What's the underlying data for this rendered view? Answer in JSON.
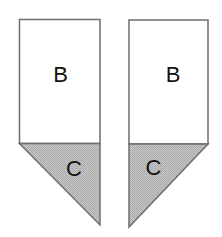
{
  "diagram": {
    "colors": {
      "background": "#ffffff",
      "stroke": "#6e6e6e",
      "fill_rect": "#ffffff",
      "fill_triangle": "#bdbdbd",
      "text": "#111111"
    },
    "shapes": [
      {
        "id": "left",
        "rect_label": "B",
        "triangle_label": "C",
        "triangle_orientation": "hypotenuse from top-left to bottom-right point"
      },
      {
        "id": "right",
        "rect_label": "B",
        "triangle_label": "C",
        "triangle_orientation": "hypotenuse from top-right to bottom-left point"
      }
    ]
  }
}
